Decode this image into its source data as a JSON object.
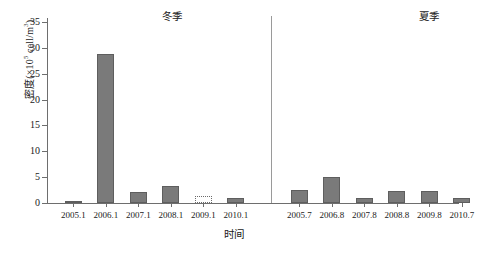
{
  "chart_data": {
    "type": "bar",
    "title": "",
    "xlabel": "时间",
    "ylabel": "密度(×10⁵ cell/m³)",
    "ylabel_parts": {
      "pre": "密度(×10",
      "sup": "5",
      "post": " cell/m",
      "sup2": "3",
      "post2": ")"
    },
    "ylim": [
      0,
      35
    ],
    "yticks": [
      0,
      5,
      10,
      15,
      20,
      25,
      30,
      35
    ],
    "grid": false,
    "legend": false,
    "bar_color": "#7a7a7a",
    "bar_edge_color": "#5e5e5e",
    "groups": [
      {
        "name": "冬季",
        "categories": [
          "2005.1",
          "2006.1",
          "2007.1",
          "2008.1",
          "2009.1",
          "2010.1"
        ],
        "values": [
          0.4,
          28.8,
          2.1,
          3.2,
          0.05,
          1.0
        ],
        "styles": [
          "solid",
          "solid",
          "solid",
          "solid",
          "dotted",
          "solid"
        ]
      },
      {
        "name": "夏季",
        "categories": [
          "2005.7",
          "2006.8",
          "2007.8",
          "2008.8",
          "2009.8",
          "2010.7"
        ],
        "values": [
          2.6,
          5.0,
          0.9,
          2.4,
          2.3,
          0.9
        ],
        "styles": [
          "solid",
          "solid",
          "solid",
          "solid",
          "solid",
          "solid"
        ]
      }
    ]
  },
  "labels": {
    "season_winter": "冬季",
    "season_summer": "夏季",
    "x_axis_title": "时间",
    "y_ticks": [
      "0",
      "5",
      "10",
      "15",
      "20",
      "25",
      "30",
      "35"
    ],
    "x_ticks": [
      "2005.1",
      "2006.1",
      "2007.1",
      "2008.1",
      "2009.1",
      "2010.1",
      "2005.7",
      "2006.8",
      "2007.8",
      "2008.8",
      "2009.8",
      "2010.7"
    ]
  }
}
